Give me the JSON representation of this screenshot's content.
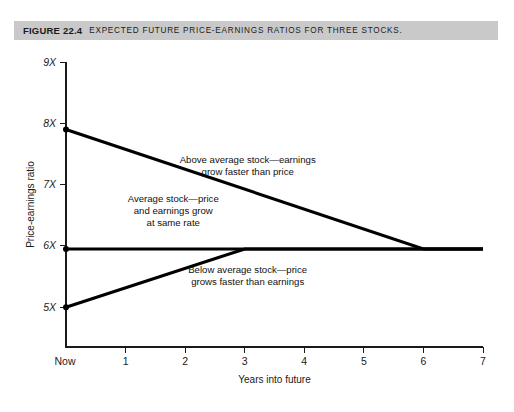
{
  "caption": {
    "figure_number": "FIGURE 22.4",
    "title": "Expected future price-earnings ratios for three stocks.",
    "bar_color": "#c9c9c9"
  },
  "chart_data": {
    "type": "line",
    "title": "Expected future price-earnings ratios for three stocks.",
    "xlabel": "Years into future",
    "ylabel": "Price-earnings ratio",
    "x_tick_labels": [
      "Now",
      "1",
      "2",
      "3",
      "4",
      "5",
      "6",
      "7"
    ],
    "x_tick_values": [
      0,
      1,
      2,
      3,
      4,
      5,
      6,
      7
    ],
    "y_tick_labels": [
      "5X",
      "6X",
      "7X",
      "8X",
      "9X"
    ],
    "y_tick_values": [
      5,
      6,
      7,
      8,
      9
    ],
    "xlim": [
      0,
      7
    ],
    "ylim": [
      4.35,
      9
    ],
    "grid": false,
    "legend": "none",
    "line_color": "#000000",
    "series": [
      {
        "name": "Above average stock",
        "points": [
          [
            0,
            7.9
          ],
          [
            6,
            5.95
          ],
          [
            7,
            5.95
          ]
        ]
      },
      {
        "name": "Average stock",
        "points": [
          [
            0,
            5.95
          ],
          [
            7,
            5.95
          ]
        ]
      },
      {
        "name": "Below average stock",
        "points": [
          [
            0,
            5.0
          ],
          [
            3,
            5.95
          ],
          [
            7,
            5.95
          ]
        ]
      }
    ],
    "annotations": [
      {
        "name": "above-average-label",
        "lines": [
          "Above average stock—earnings",
          "grow faster than price"
        ],
        "x": 3.05,
        "y": 7.35
      },
      {
        "name": "average-label",
        "lines": [
          "Average stock—price",
          "and earnings grow",
          "at same rate"
        ],
        "x": 1.8,
        "y": 6.72
      },
      {
        "name": "below-average-label",
        "lines": [
          "Below average stock—price",
          "grows faster than earnings"
        ],
        "x": 3.05,
        "y": 5.55
      }
    ]
  }
}
